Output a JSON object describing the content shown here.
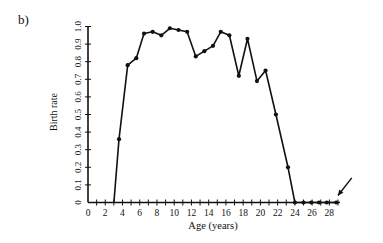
{
  "panel_label": "b)",
  "chart_data": {
    "type": "line",
    "title": "",
    "xlabel": "Age (years)",
    "ylabel": "Birth rate",
    "xlim": [
      0,
      29
    ],
    "ylim": [
      0,
      1.0
    ],
    "x_ticks": [
      0,
      2,
      4,
      6,
      8,
      10,
      12,
      14,
      16,
      18,
      20,
      22,
      24,
      26,
      28
    ],
    "x_minor_step": 1,
    "y_ticks": [
      0,
      0.1,
      0.2,
      0.3,
      0.4,
      0.5,
      0.6,
      0.7,
      0.8,
      0.9,
      1.0
    ],
    "y_tick_labels": [
      "0",
      "0.1",
      "0.2",
      "0.3",
      "0.4",
      "0.5",
      "0.6",
      "0.7",
      "0.8",
      "0.9",
      "1.0"
    ],
    "grid": false,
    "legend": null,
    "series": [
      {
        "name": "Birth rate",
        "line_start": {
          "x": 3.0,
          "y": 0
        },
        "points": [
          {
            "x": 3.6,
            "y": 0.36
          },
          {
            "x": 4.6,
            "y": 0.78
          },
          {
            "x": 5.6,
            "y": 0.82
          },
          {
            "x": 6.5,
            "y": 0.96
          },
          {
            "x": 7.5,
            "y": 0.97
          },
          {
            "x": 8.5,
            "y": 0.95
          },
          {
            "x": 9.5,
            "y": 0.99
          },
          {
            "x": 10.5,
            "y": 0.98
          },
          {
            "x": 11.5,
            "y": 0.97
          },
          {
            "x": 12.5,
            "y": 0.83
          },
          {
            "x": 13.5,
            "y": 0.86
          },
          {
            "x": 14.5,
            "y": 0.89
          },
          {
            "x": 15.4,
            "y": 0.97
          },
          {
            "x": 16.4,
            "y": 0.95
          },
          {
            "x": 17.5,
            "y": 0.72
          },
          {
            "x": 18.5,
            "y": 0.93
          },
          {
            "x": 19.6,
            "y": 0.69
          },
          {
            "x": 20.6,
            "y": 0.75
          },
          {
            "x": 21.8,
            "y": 0.5
          },
          {
            "x": 23.2,
            "y": 0.2
          },
          {
            "x": 24.0,
            "y": 0
          },
          {
            "x": 25.0,
            "y": 0
          },
          {
            "x": 25.9,
            "y": 0
          },
          {
            "x": 26.8,
            "y": 0
          },
          {
            "x": 27.7,
            "y": 0
          },
          {
            "x": 28.8,
            "y": 0
          }
        ]
      }
    ],
    "annotations": [
      {
        "type": "arrow",
        "from": {
          "x": 30.6,
          "y": 0.14
        },
        "to": {
          "x": 29.0,
          "y": 0.04
        },
        "text": ""
      }
    ]
  }
}
